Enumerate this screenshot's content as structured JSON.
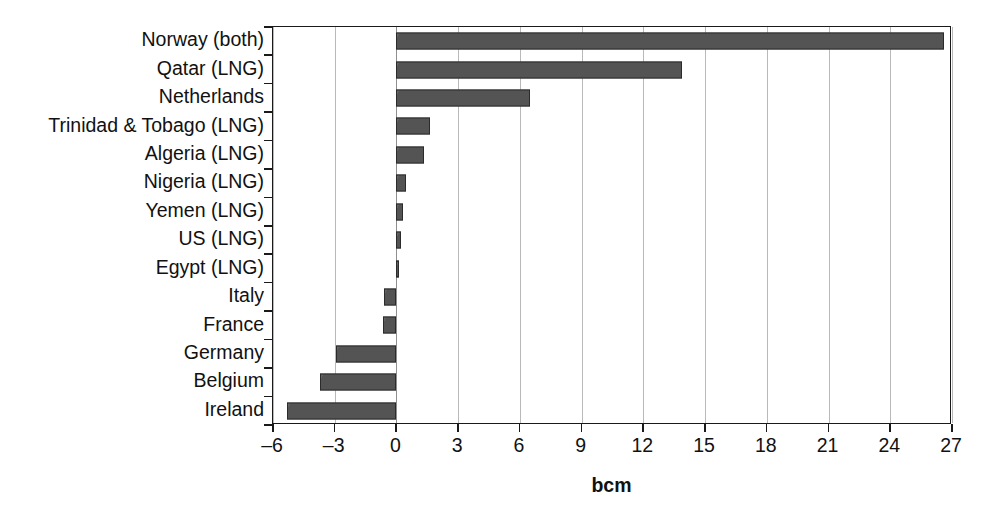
{
  "chart_data": {
    "type": "bar",
    "orientation": "horizontal",
    "title": "",
    "xlabel": "bcm",
    "ylabel": "",
    "xlim": [
      -6,
      27
    ],
    "xticks": [
      -6,
      -3,
      0,
      3,
      6,
      9,
      12,
      15,
      18,
      21,
      24,
      27
    ],
    "xticklabels": [
      "–6",
      "–3",
      "0",
      "3",
      "6",
      "9",
      "12",
      "15",
      "18",
      "21",
      "24",
      "27"
    ],
    "grid": "vertical",
    "legend": "none",
    "bar_color": "#585858",
    "bar_edge_color": "#2b2b2b",
    "categories": [
      "Norway (both)",
      "Qatar (LNG)",
      "Netherlands",
      "Trinidad & Tobago (LNG)",
      "Algeria (LNG)",
      "Nigeria (LNG)",
      "Yemen (LNG)",
      "US (LNG)",
      "Egypt (LNG)",
      "Italy",
      "France",
      "Germany",
      "Belgium",
      "Ireland"
    ],
    "values": [
      26.6,
      13.9,
      6.5,
      1.65,
      1.35,
      0.45,
      0.3,
      0.2,
      0.1,
      -0.6,
      -0.65,
      -2.95,
      -3.7,
      -5.3
    ]
  }
}
